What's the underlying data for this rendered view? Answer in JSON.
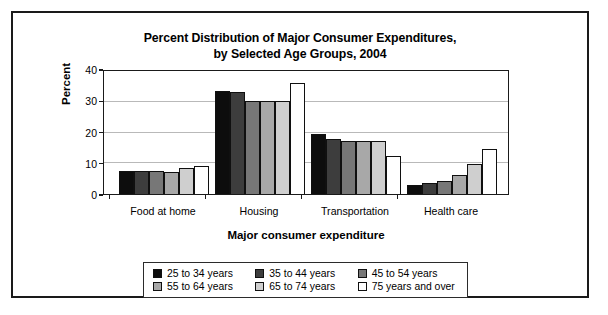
{
  "chart_data": {
    "type": "bar",
    "title": "Percent Distribution of Major Consumer Expenditures, by Selected Age Groups, 2004",
    "title_line1": "Percent Distribution of Major Consumer Expenditures,",
    "title_line2": "by Selected Age Groups, 2004",
    "xlabel": "Major consumer expenditure",
    "ylabel": "Percent",
    "ylim": [
      0,
      40
    ],
    "yticks": [
      0,
      10,
      20,
      30,
      40
    ],
    "ytick_labels": [
      "0",
      "10",
      "20",
      "30",
      "40"
    ],
    "grid": true,
    "legend_position": "below-axes",
    "categories": [
      "Food at home",
      "Housing",
      "Transportation",
      "Health care"
    ],
    "series": [
      {
        "name": "25 to 34 years",
        "color": "#0d0d0d",
        "values": [
          7.4,
          33.5,
          19.5,
          3.0
        ]
      },
      {
        "name": "35 to 44 years",
        "color": "#3d3d3d",
        "values": [
          7.6,
          33.1,
          17.9,
          3.7
        ]
      },
      {
        "name": "45 to 54 years",
        "color": "#777777",
        "values": [
          7.6,
          30.4,
          17.1,
          4.3
        ]
      },
      {
        "name": "55 to 64 years",
        "color": "#a8a8a8",
        "values": [
          7.0,
          30.1,
          17.2,
          6.2
        ]
      },
      {
        "name": "65 to 74 years",
        "color": "#cfcfcf",
        "values": [
          8.3,
          30.3,
          17.3,
          9.7
        ]
      },
      {
        "name": "75 years and over",
        "color": "#ffffff",
        "values": [
          9.2,
          36.1,
          12.3,
          14.8
        ]
      }
    ]
  }
}
